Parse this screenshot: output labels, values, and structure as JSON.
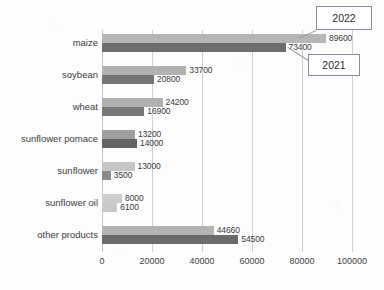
{
  "chart_data": {
    "type": "bar",
    "orientation": "horizontal",
    "title": "",
    "xlabel": "",
    "ylabel": "",
    "xlim": [
      0,
      100000
    ],
    "grid": true,
    "grid_axis": "x",
    "legend_position": "callout-annotations",
    "categories": [
      "maize",
      "soybean",
      "wheat",
      "sunflower pomace",
      "sunflower",
      "sunflower oil",
      "other products"
    ],
    "xticks": [
      0,
      20000,
      40000,
      60000,
      80000,
      100000
    ],
    "xtick_labels": [
      "0",
      "20000",
      "40000",
      "60000",
      "80000",
      "100000"
    ],
    "series": [
      {
        "name": "2022",
        "color": "#b3b3b3",
        "values": [
          89600,
          33700,
          24200,
          13200,
          13000,
          8000,
          44660
        ],
        "value_labels": [
          "89600",
          "33700",
          "24200",
          "13200",
          "13000",
          "8000",
          "44660"
        ],
        "bar_colors": [
          "#b6b6b6",
          "#b2b2b2",
          "#b0b0b0",
          "#9e9e9e",
          "#c6c6c6",
          "#cccccc",
          "#b4b4b4"
        ]
      },
      {
        "name": "2021",
        "color": "#707070",
        "values": [
          73400,
          20800,
          16900,
          14000,
          3500,
          6100,
          54500
        ],
        "value_labels": [
          "73400",
          "20800",
          "16900",
          "14000",
          "3500",
          "6100",
          "54500"
        ],
        "bar_colors": [
          "#6e6e6e",
          "#767676",
          "#787878",
          "#636363",
          "#8a8a8a",
          "#c9c9c9",
          "#6b6b6b"
        ]
      }
    ]
  },
  "annotations": {
    "callouts": [
      {
        "name": "2022",
        "label": "2022"
      },
      {
        "name": "2021",
        "label": "2021"
      }
    ]
  }
}
